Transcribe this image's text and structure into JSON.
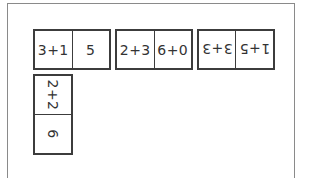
{
  "dominoes": [
    {
      "left": "3+1",
      "right": "5",
      "orientation": "horizontal"
    },
    {
      "left": "2+3",
      "right": "6+0",
      "orientation": "horizontal"
    },
    {
      "left": "1+5",
      "right": "3+3",
      "orientation": "rotated-180"
    },
    {
      "left": "2+2",
      "right": "6",
      "orientation": "rotated-90"
    }
  ],
  "colors": {
    "border": "#3c3c3c",
    "frame": "#8a8a8a",
    "background": "#ffffff"
  }
}
